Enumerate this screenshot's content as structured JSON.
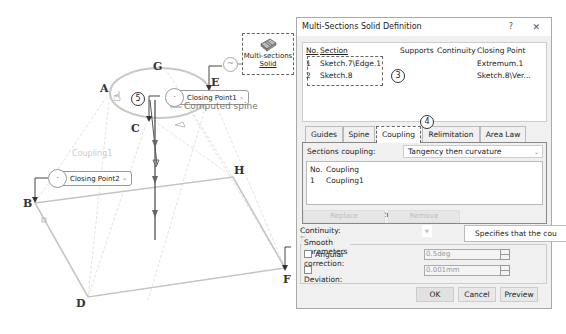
{
  "viewport": {
    "points": {
      "A": "A",
      "B": "B",
      "C": "C",
      "D": "D",
      "E": "E",
      "F": "F",
      "G": "G",
      "H": "H"
    },
    "closing_point1": "Closing Point1",
    "closing_point2": "Closing Point2",
    "computed_spine": "Computed spine",
    "coupling_label": "Coupling1",
    "mss_label_line1": "Multi-sections",
    "mss_label_line2": "Solid",
    "callout5": "5",
    "hand_glyph": "☝",
    "cp_circle_glyph": "·",
    "cp_arrow_glyph": "»",
    "mss_circle_glyph": "~"
  },
  "dialog": {
    "title": "Multi-Sections Solid Definition",
    "help": "?",
    "close": "✕",
    "sections": {
      "headers": {
        "no": "No.",
        "section": "Section",
        "supports": "Supports",
        "continuity": "Continuity",
        "closing_point": "Closing Point"
      },
      "rows": [
        {
          "no": "1",
          "section": "Sketch.7\\Edge.1",
          "supports": "",
          "continuity": "",
          "closing_point": "Extremum.1"
        },
        {
          "no": "2",
          "section": "Sketch.8",
          "supports": "",
          "continuity": "",
          "closing_point": "Sketch.8\\Ver..."
        }
      ],
      "callout3": "3"
    },
    "callout4": "4",
    "tabs": [
      {
        "label": "Guides"
      },
      {
        "label": "Spine"
      },
      {
        "label": "Coupling",
        "active": true
      },
      {
        "label": "Relimitation"
      },
      {
        "label": "Area Law"
      }
    ],
    "coupling_panel": {
      "sections_coupling_label": "Sections coupling:",
      "sections_coupling_value": "Tangency then curvature",
      "chevron": "⌄",
      "list_headers": {
        "no": "No.",
        "coupling": "Coupling"
      },
      "rows": [
        {
          "no": "1",
          "coupling": "Coupling1"
        }
      ],
      "display_coupling_curves_label": "Display coupling curves",
      "display_coupling_curves_checked": "☑"
    },
    "replace_label": "Replace",
    "remove_label": "Remove",
    "tooltip": "Specifies that the cou",
    "continuity_label": "Continuity:",
    "continuity_value": "Tangent",
    "smooth": {
      "title": "Smooth parameters",
      "angular_label": "Angular correction:",
      "angular_value": "0.5deg",
      "deviation_label": "Deviation:",
      "deviation_value": "0.001mm"
    },
    "buttons": {
      "ok": "OK",
      "cancel": "Cancel",
      "preview": "Preview"
    }
  }
}
